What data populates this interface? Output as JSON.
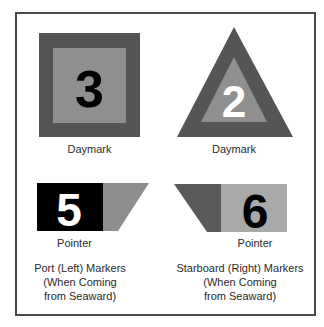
{
  "colors": {
    "frame": "#4a4a4a",
    "dark_gray": "#555555",
    "mid_gray": "#8e8e8e",
    "light_gray": "#a9a9a9",
    "black": "#000000",
    "white": "#ffffff"
  },
  "port": {
    "daymark": {
      "shape": "square",
      "number": "3",
      "label": "Daymark"
    },
    "pointer": {
      "number": "5",
      "label": "Pointer"
    },
    "caption_lines": [
      "Port (Left) Markers",
      "(When Coming",
      "from Seaward)"
    ]
  },
  "starboard": {
    "daymark": {
      "shape": "triangle",
      "number": "2",
      "label": "Daymark"
    },
    "pointer": {
      "number": "6",
      "label": "Pointer"
    },
    "caption_lines": [
      "Starboard (Right) Markers",
      "(When Coming",
      "from Seaward)"
    ]
  }
}
